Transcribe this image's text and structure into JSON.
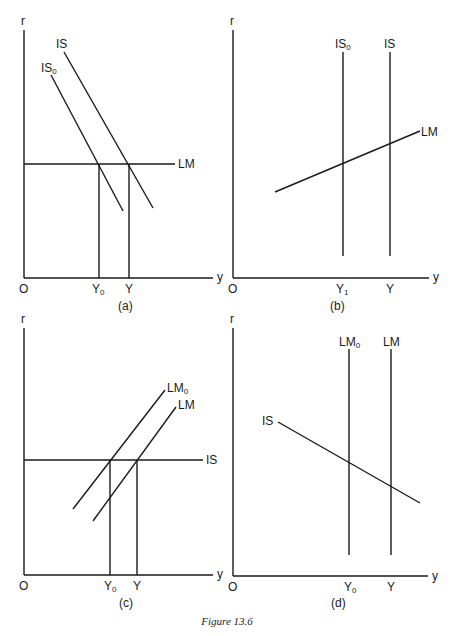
{
  "figure": {
    "caption": "Figure 13.6",
    "line_color": "#1a1a1a",
    "background": "#ffffff"
  },
  "panels": [
    {
      "id": "a",
      "caption": "(a)",
      "y_axis_label": "r",
      "x_axis_label": "y",
      "origin_label": "O",
      "curves": [
        {
          "name": "IS",
          "label": "IS",
          "sub": "",
          "shape": "downward-sloping"
        },
        {
          "name": "IS0",
          "label": "IS",
          "sub": "0",
          "shape": "downward-sloping"
        },
        {
          "name": "LM",
          "label": "LM",
          "sub": "",
          "shape": "horizontal"
        }
      ],
      "x_ticks": [
        {
          "label": "Y",
          "sub": "0"
        },
        {
          "label": "Y",
          "sub": ""
        }
      ]
    },
    {
      "id": "b",
      "caption": "(b)",
      "y_axis_label": "r",
      "x_axis_label": "y",
      "origin_label": "O",
      "curves": [
        {
          "name": "IS0",
          "label": "IS",
          "sub": "0",
          "shape": "vertical"
        },
        {
          "name": "IS",
          "label": "IS",
          "sub": "",
          "shape": "vertical"
        },
        {
          "name": "LM",
          "label": "LM",
          "sub": "",
          "shape": "upward-sloping"
        }
      ],
      "x_ticks": [
        {
          "label": "Y",
          "sub": "1"
        },
        {
          "label": "Y",
          "sub": ""
        }
      ]
    },
    {
      "id": "c",
      "caption": "(c)",
      "y_axis_label": "r",
      "x_axis_label": "y",
      "origin_label": "O",
      "curves": [
        {
          "name": "LM0",
          "label": "LM",
          "sub": "0",
          "shape": "upward-sloping"
        },
        {
          "name": "LM",
          "label": "LM",
          "sub": "",
          "shape": "upward-sloping"
        },
        {
          "name": "IS",
          "label": "IS",
          "sub": "",
          "shape": "horizontal"
        }
      ],
      "x_ticks": [
        {
          "label": "Y",
          "sub": "0"
        },
        {
          "label": "Y",
          "sub": ""
        }
      ]
    },
    {
      "id": "d",
      "caption": "(d)",
      "y_axis_label": "r",
      "x_axis_label": "y",
      "origin_label": "O",
      "curves": [
        {
          "name": "LM0",
          "label": "LM",
          "sub": "0",
          "shape": "vertical"
        },
        {
          "name": "LM",
          "label": "LM",
          "sub": "",
          "shape": "vertical"
        },
        {
          "name": "IS",
          "label": "IS",
          "sub": "",
          "shape": "downward-sloping"
        }
      ],
      "x_ticks": [
        {
          "label": "Y",
          "sub": "0"
        },
        {
          "label": "Y",
          "sub": ""
        }
      ]
    }
  ]
}
